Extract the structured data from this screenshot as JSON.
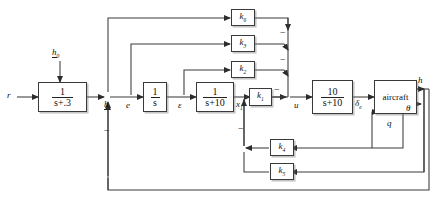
{
  "diagram": {
    "stroke_color": "#3a3a3a",
    "background": "#ffffff"
  },
  "blocks": [
    {
      "id": "lag",
      "name": "block-prefilter",
      "num": "1",
      "den": "s+.3",
      "kind": "fraction"
    },
    {
      "id": "integrator",
      "name": "block-integrator",
      "num": "1",
      "den": "s",
      "kind": "fraction"
    },
    {
      "id": "lag10",
      "name": "block-lag-s-plus-10",
      "num": "1",
      "den": "s+10",
      "kind": "fraction"
    },
    {
      "id": "actuator",
      "name": "block-actuator",
      "num": "10",
      "den": "s+10",
      "kind": "fraction"
    },
    {
      "id": "plant",
      "name": "block-aircraft",
      "text": "aircraft",
      "kind": "text"
    }
  ],
  "gains": [
    {
      "id": "k6",
      "name": "gain-block-k6",
      "label": "k",
      "sub": "6"
    },
    {
      "id": "k3",
      "name": "gain-block-k3",
      "label": "k",
      "sub": "3"
    },
    {
      "id": "k2",
      "name": "gain-block-k2",
      "label": "k",
      "sub": "2"
    },
    {
      "id": "k1",
      "name": "gain-block-k1",
      "label": "k",
      "sub": "1"
    },
    {
      "id": "k4",
      "name": "gain-block-k4",
      "label": "k",
      "sub": "4"
    },
    {
      "id": "k5",
      "name": "gain-block-k5",
      "label": "k",
      "sub": "5"
    }
  ],
  "signals": {
    "reference": "r",
    "command": "h",
    "command_sub": "0",
    "altitude_error": "h",
    "error": "e",
    "epsilon": "ε",
    "state_x1": "x",
    "state_x1_sub": "1",
    "control": "u",
    "elevator": "δ",
    "elevator_sub": "e",
    "altitude": "h",
    "pitch": "θ",
    "pitch_rate": "q"
  },
  "signs": {
    "sum1_minus": "−",
    "sum2_minus_a": "−",
    "sum2_minus_b": "−",
    "sum2_minus_c": "−",
    "sum3_minus": "−"
  }
}
